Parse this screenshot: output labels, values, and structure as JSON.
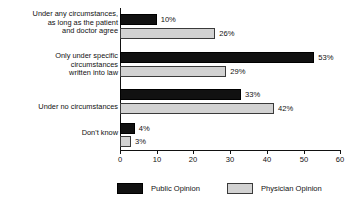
{
  "chart_data": {
    "type": "bar",
    "orientation": "horizontal",
    "title": "",
    "xlabel": "",
    "ylabel": "",
    "xlim": [
      0,
      60
    ],
    "xticks": [
      "0",
      "10",
      "20",
      "30",
      "40",
      "50",
      "60"
    ],
    "grid": false,
    "legend_position": "bottom",
    "categories": [
      "Under any circumstances,\nas long as the patient\nand doctor agree",
      "Only under specific\ncircumstances\nwritten into law",
      "Under no circumstances",
      "Don't know"
    ],
    "series": [
      {
        "name": "Public Opinion",
        "color": "#111111",
        "values": [
          10,
          53,
          33,
          4
        ],
        "labels": [
          "10%",
          "53%",
          "33%",
          "4%"
        ]
      },
      {
        "name": "Physician Opinion",
        "color": "#d2d2d2",
        "values": [
          26,
          29,
          42,
          3
        ],
        "labels": [
          "26%",
          "29%",
          "42%",
          "3%"
        ]
      }
    ]
  },
  "legend": {
    "entries": [
      {
        "label": "Public Opinion"
      },
      {
        "label": "Physician Opinion"
      }
    ]
  },
  "axis": {
    "ticks": [
      {
        "label": "0"
      },
      {
        "label": "10"
      },
      {
        "label": "20"
      },
      {
        "label": "30"
      },
      {
        "label": "40"
      },
      {
        "label": "50"
      },
      {
        "label": "60"
      }
    ]
  }
}
